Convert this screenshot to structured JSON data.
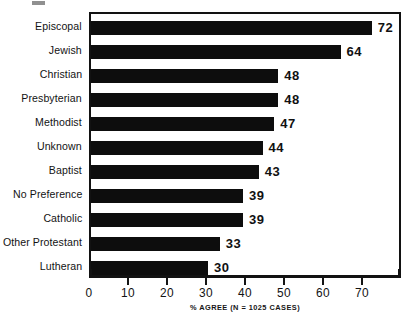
{
  "chart_data": {
    "type": "bar",
    "orientation": "horizontal",
    "title": "",
    "xlabel": "% AGREE (N = 1025 CASES)",
    "ylabel": "",
    "xlim": [
      0,
      80
    ],
    "grid": false,
    "legend": null,
    "categories": [
      "Episcopal",
      "Jewish",
      "Christian",
      "Presbyterian",
      "Methodist",
      "Unknown",
      "Baptist",
      "No Preference",
      "Catholic",
      "Other Protestant",
      "Lutheran"
    ],
    "values": [
      72,
      64,
      48,
      48,
      47,
      44,
      43,
      39,
      39,
      33,
      30
    ],
    "value_labels": [
      "72",
      "64",
      "48",
      "48",
      "47",
      "44",
      "43",
      "39",
      "39",
      "33",
      "30"
    ],
    "xticks": [
      0,
      10,
      20,
      30,
      40,
      50,
      60,
      70
    ],
    "xtick_labels": [
      "0",
      "10",
      "20",
      "30",
      "40",
      "50",
      "60",
      "70"
    ],
    "bar_color": "#0d0d0d",
    "axis_color": "#121212",
    "background_color": "#ffffff"
  },
  "caption": {
    "text": "% AGREE (N = 1025 CASES)"
  }
}
